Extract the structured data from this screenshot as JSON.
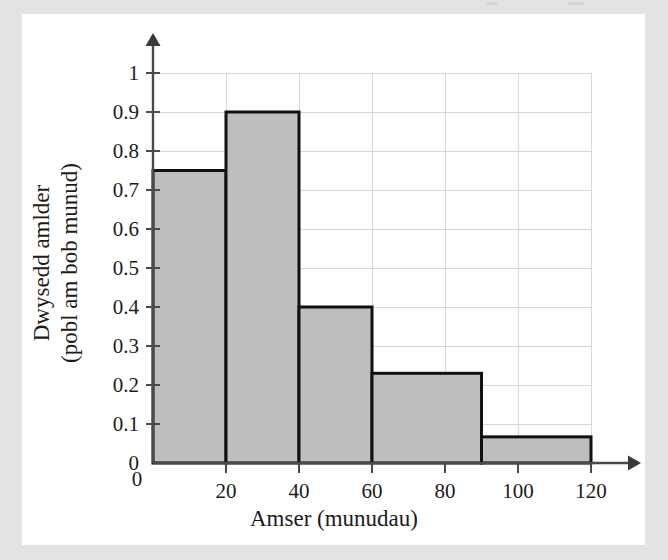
{
  "page": {
    "background_color": "#e3e3e3",
    "card_color": "#ffffff"
  },
  "chart_data": {
    "type": "bar",
    "title": "",
    "subtitle": "",
    "xlabel": "Amser (munudau)",
    "ylabel": "Dwysedd amlder (pobl am bob munud)",
    "ylabel_line1": "Dwysedd amlder",
    "ylabel_line2": "(pobl am bob munud)",
    "xlim": [
      0,
      120
    ],
    "ylim": [
      0,
      1
    ],
    "grid": true,
    "legend": "none",
    "bar_fill_color": "#bebebe",
    "bar_edge_color": "#111111",
    "axis_color": "#4a4a4a",
    "gridline_color": "#d8d8d8",
    "xticks": [
      0,
      20,
      40,
      60,
      80,
      100,
      120
    ],
    "xtick_labels": [
      "0",
      "20",
      "40",
      "60",
      "80",
      "100",
      "120"
    ],
    "yticks": [
      0,
      0.1,
      0.2,
      0.3,
      0.4,
      0.5,
      0.6,
      0.7,
      0.8,
      0.9,
      1
    ],
    "ytick_labels": [
      "0",
      "0.1",
      "0.2",
      "0.3",
      "0.4",
      "0.5",
      "0.6",
      "0.7",
      "0.8",
      "0.9",
      "1"
    ],
    "bins": [
      {
        "label": "0-20",
        "x_start": 0,
        "x_end": 20,
        "value": 0.75
      },
      {
        "label": "20-40",
        "x_start": 20,
        "x_end": 40,
        "value": 0.9
      },
      {
        "label": "40-60",
        "x_start": 40,
        "x_end": 60,
        "value": 0.4
      },
      {
        "label": "60-90",
        "x_start": 60,
        "x_end": 90,
        "value": 0.23
      },
      {
        "label": "90-120",
        "x_start": 90,
        "x_end": 120,
        "value": 0.067
      }
    ],
    "categories": [
      "0-20",
      "20-40",
      "40-60",
      "60-90",
      "90-120"
    ],
    "values": [
      0.75,
      0.9,
      0.4,
      0.23,
      0.067
    ]
  }
}
